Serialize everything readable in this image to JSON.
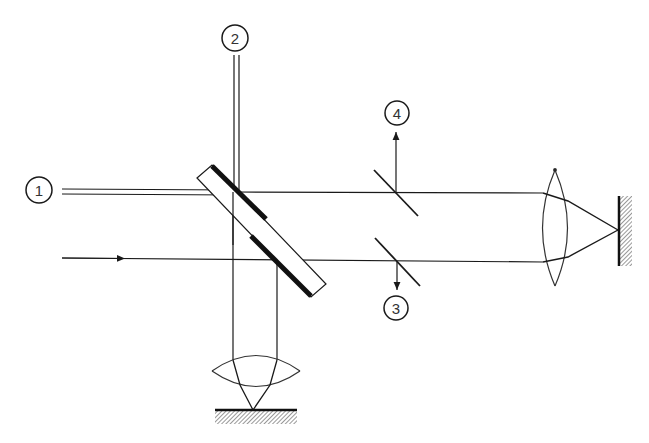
{
  "diagram": {
    "type": "optical-interferometer-schematic",
    "ports": [
      {
        "id": "port-1",
        "label": "1",
        "cx": 39,
        "cy": 190
      },
      {
        "id": "port-2",
        "label": "2",
        "cx": 235,
        "cy": 38
      },
      {
        "id": "port-3",
        "label": "3",
        "cx": 396,
        "cy": 308
      },
      {
        "id": "port-4",
        "label": "4",
        "cx": 397,
        "cy": 113
      }
    ],
    "colors": {
      "ink": "#1a1a1a",
      "background": "#ffffff"
    }
  }
}
